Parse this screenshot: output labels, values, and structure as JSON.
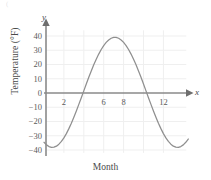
{
  "figure": {
    "width": 211,
    "height": 180,
    "background": "#ffffff",
    "corner_mark": "("
  },
  "axis_letters": {
    "x": "x",
    "y": "y"
  },
  "colors": {
    "curve": "#8f8f8f",
    "axis": "#8a8a8a",
    "grid": "#efefef",
    "text": "#4a4a4a",
    "tick_text": "#5a5a5a",
    "background": "#ffffff"
  },
  "chart_data": {
    "type": "line",
    "title": "",
    "subtitle": "",
    "xlabel": "Month",
    "ylabel": "Temperature (°F)",
    "xlim": [
      0,
      14.6
    ],
    "ylim": [
      -42,
      44
    ],
    "grid": true,
    "legend": null,
    "x_ticks": [
      2,
      6,
      8,
      12
    ],
    "x_tick_labels": [
      "2",
      "6",
      "8",
      "12"
    ],
    "x_gridlines": [
      2,
      4,
      6,
      8,
      10,
      12
    ],
    "y_ticks": [
      40,
      30,
      20,
      10,
      0,
      -10,
      -20,
      -30,
      -40
    ],
    "y_tick_labels": [
      "40",
      "30",
      "20",
      "10",
      "0",
      "−10",
      "−20",
      "−30",
      "−40"
    ],
    "y_gridlines": [
      40,
      30,
      20,
      10,
      -10,
      -20,
      -30,
      -40
    ],
    "annotations": [],
    "curve_model": {
      "form": "sinusoid",
      "amplitude": 38.5,
      "vertical_shift": 0.5,
      "period": 12.4,
      "phase_min_month": 1.3,
      "phase_max_month": 7.5,
      "minimum_value": -38,
      "maximum_value": 39,
      "zero_crossings": [
        4.4,
        11.1
      ]
    },
    "x": [
      0,
      0.25,
      0.5,
      0.75,
      1,
      1.25,
      1.5,
      1.75,
      2,
      2.25,
      2.5,
      2.75,
      3,
      3.25,
      3.5,
      3.75,
      4,
      4.25,
      4.5,
      4.75,
      5,
      5.25,
      5.5,
      5.75,
      6,
      6.25,
      6.5,
      6.75,
      7,
      7.25,
      7.5,
      7.75,
      8,
      8.25,
      8.5,
      8.75,
      9,
      9.25,
      9.5,
      9.75,
      10,
      10.25,
      10.5,
      10.75,
      11,
      11.25,
      11.5,
      11.75,
      12,
      12.25,
      12.5,
      12.75,
      13,
      13.25,
      13.5,
      13.75,
      14,
      14.25,
      14.5
    ],
    "y": [
      -34.6,
      -36.4,
      -37.6,
      -38.2,
      -38.0,
      -37.3,
      -35.9,
      -34.0,
      -31.5,
      -28.5,
      -25.0,
      -21.2,
      -17.0,
      -12.6,
      -8.0,
      -3.3,
      1.5,
      6.3,
      11.0,
      15.5,
      19.8,
      23.7,
      27.3,
      30.5,
      33.3,
      35.5,
      37.2,
      38.4,
      39.0,
      39.0,
      38.4,
      37.2,
      35.5,
      33.3,
      30.5,
      27.3,
      23.7,
      19.8,
      15.5,
      11.0,
      6.3,
      1.5,
      -3.3,
      -8.0,
      -12.6,
      -17.0,
      -21.2,
      -25.0,
      -28.5,
      -31.5,
      -34.0,
      -35.9,
      -37.3,
      -38.0,
      -38.2,
      -37.6,
      -36.4,
      -34.6,
      -32.3
    ]
  }
}
